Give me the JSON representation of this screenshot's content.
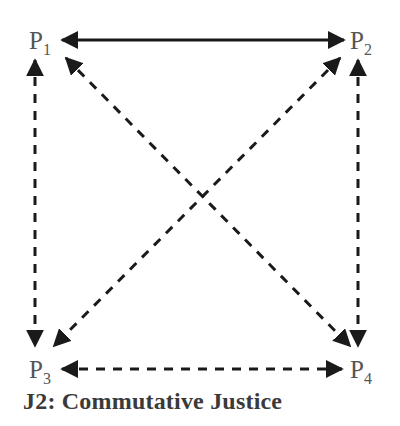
{
  "diagram": {
    "caption": "J2: Commutative Justice",
    "nodes": [
      {
        "id": "P1",
        "base": "P",
        "sub": "1"
      },
      {
        "id": "P2",
        "base": "P",
        "sub": "2"
      },
      {
        "id": "P3",
        "base": "P",
        "sub": "3"
      },
      {
        "id": "P4",
        "base": "P",
        "sub": "4"
      }
    ],
    "edges": [
      {
        "from": "P1",
        "to": "P2",
        "style": "solid",
        "direction": "both"
      },
      {
        "from": "P1",
        "to": "P3",
        "style": "dashed",
        "direction": "both"
      },
      {
        "from": "P2",
        "to": "P4",
        "style": "dashed",
        "direction": "both"
      },
      {
        "from": "P3",
        "to": "P4",
        "style": "dashed",
        "direction": "both"
      },
      {
        "from": "P1",
        "to": "P4",
        "style": "dashed",
        "direction": "both"
      },
      {
        "from": "P2",
        "to": "P3",
        "style": "dashed",
        "direction": "both"
      }
    ],
    "colors": {
      "line": "#1a1a1a",
      "label": "#555555",
      "caption": "#3a3a3a"
    }
  }
}
